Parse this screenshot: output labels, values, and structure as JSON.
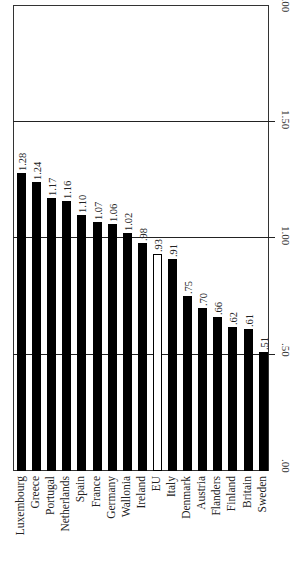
{
  "chart_data": {
    "type": "bar",
    "orientation": "vertical bars, figure rotated 90° (labels read sideways)",
    "title": "",
    "xlabel": "",
    "ylabel": "",
    "categories": [
      "Luxembourg",
      "Greece",
      "Portugal",
      "Netherlands",
      "Spain",
      "France",
      "Germany",
      "Wallonia",
      "Ireland",
      "EU",
      "Italy",
      "Denmark",
      "Austria",
      "Flanders",
      "Finland",
      "Britain",
      "Sweden"
    ],
    "values": [
      1.28,
      1.24,
      1.17,
      1.16,
      1.1,
      1.07,
      1.06,
      1.02,
      0.98,
      0.93,
      0.91,
      0.75,
      0.7,
      0.66,
      0.62,
      0.61,
      0.51
    ],
    "value_labels": [
      "1.28",
      "1.24",
      "1.17",
      "1.16",
      "1.10",
      "1.07",
      "1.06",
      "1.02",
      ".98",
      ".93",
      ".91",
      ".75",
      ".70",
      ".66",
      ".62",
      ".61",
      ".51"
    ],
    "highlight": {
      "category": "EU",
      "style": "white bar with black outline"
    },
    "ylim": [
      0,
      2.0
    ],
    "y_ticks": [
      0,
      0.5,
      1.0,
      1.5,
      2.0
    ],
    "y_tick_labels": [
      ".00",
      ".50",
      "1.00",
      "1.50",
      "2.00"
    ],
    "grid": true,
    "legend": null
  },
  "colors": {
    "bar": "#000000",
    "highlight_bar": "#ffffff",
    "frame": "#333333"
  }
}
